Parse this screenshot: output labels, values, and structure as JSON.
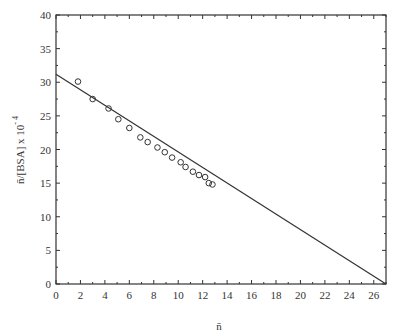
{
  "chart_data": {
    "type": "scatter",
    "title": "",
    "xlabel": "n̄",
    "ylabel": "n̄/[BSA] x 10",
    "ylabel_exponent": "- 4",
    "xlim": [
      0,
      27
    ],
    "ylim": [
      0,
      40
    ],
    "x_ticks": [
      0,
      2,
      4,
      6,
      8,
      10,
      12,
      14,
      16,
      18,
      20,
      22,
      24,
      26
    ],
    "y_ticks": [
      0,
      5,
      10,
      15,
      20,
      25,
      30,
      35,
      40
    ],
    "grid": false,
    "legend": null,
    "series": [
      {
        "name": "data",
        "marker": "open-circle",
        "x": [
          1.8,
          3.0,
          4.3,
          5.1,
          6.0,
          6.9,
          7.5,
          8.3,
          8.9,
          9.5,
          10.2,
          10.6,
          11.2,
          11.7,
          12.2,
          12.5,
          12.8
        ],
        "y": [
          30.1,
          27.5,
          26.1,
          24.5,
          23.2,
          21.8,
          21.1,
          20.3,
          19.6,
          18.8,
          18.1,
          17.4,
          16.7,
          16.2,
          15.9,
          15.0,
          14.8
        ]
      },
      {
        "name": "fit-line",
        "marker": "line",
        "x": [
          0,
          27
        ],
        "y": [
          31.2,
          0
        ]
      }
    ]
  },
  "style": {
    "axis_color": "#333333",
    "marker_color": "#333333",
    "line_color": "#333333",
    "background": "#ffffff"
  }
}
